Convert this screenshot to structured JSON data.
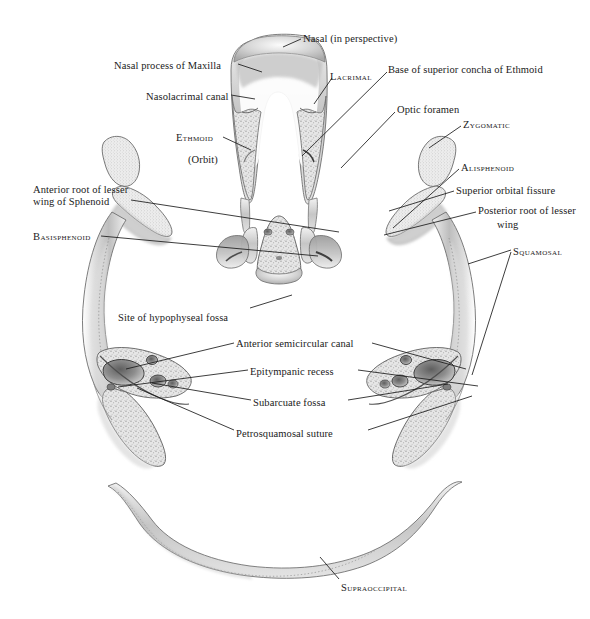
{
  "figure": {
    "kind": "anatomical-illustration",
    "background_color": "#ffffff",
    "ink_color": "#1a1a1a",
    "bone_tone_light": "#e8e8e8",
    "bone_tone_mid": "#c9c9c9",
    "bone_tone_dark": "#9a9a9a"
  },
  "labels": [
    {
      "id": "nasal-perspective",
      "text": "Nasal (in perspective)",
      "style": "mixed",
      "x": 303,
      "y": 33,
      "align": "left"
    },
    {
      "id": "nasal-process-maxilla",
      "text": "Nasal  process of Maxilla",
      "style": "mixed",
      "x": 114,
      "y": 60,
      "align": "left"
    },
    {
      "id": "lacrimal",
      "text": "Lacrimal",
      "style": "caps",
      "x": 330,
      "y": 71,
      "align": "left"
    },
    {
      "id": "base-superior-concha",
      "text": "Base of superior  concha of Ethmoid",
      "style": "mixed",
      "x": 388,
      "y": 64,
      "align": "left"
    },
    {
      "id": "nasolacrimal-canal",
      "text": "Nasolacrimal canal",
      "style": "mixed",
      "x": 146,
      "y": 91,
      "align": "left"
    },
    {
      "id": "optic-foramen",
      "text": "Optic foramen",
      "style": "mixed",
      "x": 397,
      "y": 104,
      "align": "left"
    },
    {
      "id": "zygomatic",
      "text": "Zygomatic",
      "style": "caps",
      "x": 463,
      "y": 119,
      "align": "left"
    },
    {
      "id": "ethmoid",
      "text": "Ethmoid",
      "style": "caps",
      "x": 176,
      "y": 132,
      "align": "left"
    },
    {
      "id": "orbit",
      "text": "(Orbit)",
      "style": "mixed",
      "x": 188,
      "y": 154,
      "align": "left"
    },
    {
      "id": "alisphenoid",
      "text": "Alisphenoid",
      "style": "caps",
      "x": 461,
      "y": 162,
      "align": "left"
    },
    {
      "id": "superior-orbital-fissure",
      "text": "Superior orbital fissure",
      "style": "mixed",
      "x": 456,
      "y": 185,
      "align": "left"
    },
    {
      "id": "anterior-root-lesser-1",
      "text": "Anterior root of lesser",
      "style": "mixed",
      "x": 33,
      "y": 184,
      "align": "left"
    },
    {
      "id": "anterior-root-lesser-2",
      "text": "wing of Sphenoid",
      "style": "mixed",
      "x": 33,
      "y": 196,
      "align": "left"
    },
    {
      "id": "posterior-root-lesser-1",
      "text": "Posterior root of lesser",
      "style": "mixed",
      "x": 478,
      "y": 205,
      "align": "left"
    },
    {
      "id": "posterior-root-lesser-2",
      "text": "wing",
      "style": "mixed",
      "x": 497,
      "y": 219,
      "align": "left"
    },
    {
      "id": "basisphenoid",
      "text": "Basisphenoid",
      "style": "caps",
      "x": 33,
      "y": 231,
      "align": "left"
    },
    {
      "id": "squamosal",
      "text": "Squamosal",
      "style": "caps",
      "x": 513,
      "y": 246,
      "align": "left"
    },
    {
      "id": "site-hypophyseal-fossa",
      "text": "Site of hypophyseal fossa",
      "style": "mixed",
      "x": 118,
      "y": 312,
      "align": "left"
    },
    {
      "id": "anterior-semicircular",
      "text": "Anterior semicircular canal",
      "style": "mixed",
      "x": 236,
      "y": 338,
      "align": "left"
    },
    {
      "id": "epitympanic-recess",
      "text": "Epitympanic recess",
      "style": "mixed",
      "x": 250,
      "y": 366,
      "align": "left"
    },
    {
      "id": "subarcuate-fossa",
      "text": "Subarcuate fossa",
      "style": "mixed",
      "x": 253,
      "y": 397,
      "align": "left"
    },
    {
      "id": "petrosquamosal-suture",
      "text": "Petrosquamosal  suture",
      "style": "mixed",
      "x": 236,
      "y": 428,
      "align": "left"
    },
    {
      "id": "supraoccipital",
      "text": "Supraoccipital",
      "style": "caps",
      "x": 341,
      "y": 582,
      "align": "left"
    }
  ],
  "leaders": [
    {
      "id": "leader-nasal-perspective",
      "for": "nasal-perspective",
      "points": "301,39 283,47"
    },
    {
      "id": "leader-nasal-process-maxilla",
      "for": "nasal-process-maxilla",
      "points": "238,64 262,72"
    },
    {
      "id": "leader-lacrimal",
      "for": "lacrimal",
      "points": "332,78 314,104"
    },
    {
      "id": "leader-base-superior-concha",
      "for": "base-superior-concha",
      "points": "387,72 302,156"
    },
    {
      "id": "leader-nasolacrimal-canal",
      "for": "nasolacrimal-canal",
      "points": "231,95 255,99"
    },
    {
      "id": "leader-optic-foramen",
      "for": "optic-foramen",
      "points": "395,112 341,168"
    },
    {
      "id": "leader-zygomatic",
      "for": "zygomatic",
      "points": "461,126 429,148"
    },
    {
      "id": "leader-ethmoid",
      "for": "ethmoid",
      "points": "223,137 251,150"
    },
    {
      "id": "leader-alisphenoid",
      "for": "alisphenoid",
      "points": "459,169 393,228"
    },
    {
      "id": "leader-superior-orbital",
      "for": "superior-orbital-fissure",
      "points": "454,191 389,211"
    },
    {
      "id": "leader-anterior-root",
      "for": "anterior-root-lesser",
      "points": "131,200 339,232"
    },
    {
      "id": "leader-posterior-root",
      "for": "posterior-root-lesser",
      "points": "476,212 384,235"
    },
    {
      "id": "leader-basisphenoid",
      "for": "basisphenoid",
      "points": "101,236 318,256"
    },
    {
      "id": "leader-squamosal-a",
      "for": "squamosal",
      "points": "511,250 468,264"
    },
    {
      "id": "leader-squamosal-b",
      "for": "squamosal",
      "points": "511,252 472,375"
    },
    {
      "id": "leader-site-hypophyseal",
      "for": "site-hypophyseal-fossa",
      "points": "250,308 292,295"
    },
    {
      "id": "leader-ant-semicircular-L",
      "for": "anterior-semicircular",
      "points": "234,343 126,369"
    },
    {
      "id": "leader-ant-semicircular-R",
      "for": "anterior-semicircular",
      "points": "372,343 466,369"
    },
    {
      "id": "leader-epitympanic-L",
      "for": "epitympanic-recess",
      "points": "248,370 118,387"
    },
    {
      "id": "leader-epitympanic-R",
      "for": "epitympanic-recess",
      "points": "358,370 478,386"
    },
    {
      "id": "leader-subarcuate-L",
      "for": "subarcuate-fossa",
      "points": "251,400 152,383"
    },
    {
      "id": "leader-subarcuate-R",
      "for": "subarcuate-fossa",
      "points": "348,400 448,384"
    },
    {
      "id": "leader-petrosquamosal-L",
      "for": "petrosquamosal-suture",
      "points": "234,430 137,388"
    },
    {
      "id": "leader-petrosquamosal-R",
      "for": "petrosquamosal-suture",
      "points": "368,430 472,396"
    },
    {
      "id": "leader-supraoccipital",
      "for": "supraoccipital",
      "points": "339,579 320,557"
    }
  ]
}
